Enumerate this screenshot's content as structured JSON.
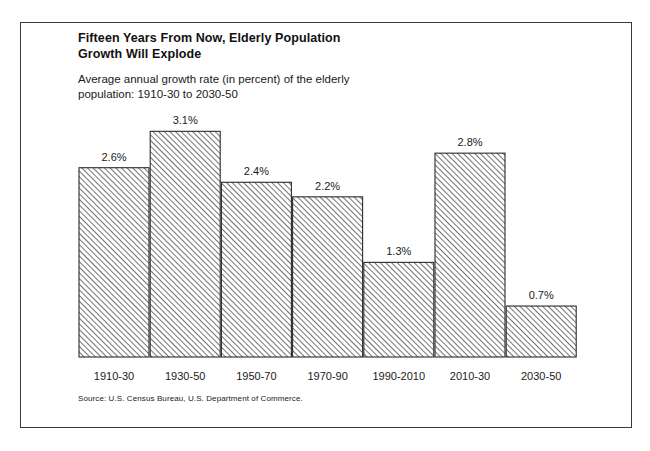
{
  "figure": {
    "title_line1": "Fifteen Years From Now, Elderly Population",
    "title_line2": "Growth Will Explode",
    "subtitle_line1": "Average annual growth rate (in percent) of the elderly",
    "subtitle_line2": "population:  1910-30 to 2030-50",
    "source": "Source:  U.S. Census Bureau, U.S. Department of Commerce.",
    "border_color": "#3a3a3a",
    "bar_outline_color": "#2b2b2b",
    "bar_fill": "diagonal-hatch",
    "background": "#ffffff"
  },
  "chart_data": {
    "type": "bar",
    "title": "Fifteen Years From Now, Elderly Population Growth Will Explode",
    "subtitle": "Average annual growth rate (in percent) of the elderly population:  1910-30 to 2030-50",
    "xlabel": "",
    "ylabel": "",
    "ylim": [
      0,
      3.4
    ],
    "grid": false,
    "legend": false,
    "categories": [
      "1910-30",
      "1930-50",
      "1950-70",
      "1970-90",
      "1990-2010",
      "2010-30",
      "2030-50"
    ],
    "values": [
      2.6,
      3.1,
      2.4,
      2.2,
      1.3,
      2.8,
      0.7
    ],
    "data_labels": [
      "2.6%",
      "3.1%",
      "2.4%",
      "2.2%",
      "1.3%",
      "2.8%",
      "0.7%"
    ],
    "units": "percent"
  }
}
